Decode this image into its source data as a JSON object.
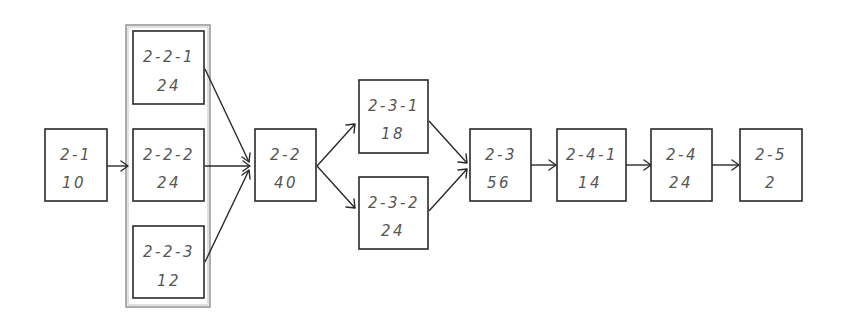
{
  "diagram": {
    "type": "network-schedule",
    "group": {
      "name": "parallel-group-2-2",
      "members": [
        "2-2-1",
        "2-2-2",
        "2-2-3"
      ]
    },
    "nodes": [
      {
        "id": "2-1",
        "label": "2-1",
        "value": "10"
      },
      {
        "id": "2-2-1",
        "label": "2-2-1",
        "value": "24"
      },
      {
        "id": "2-2-2",
        "label": "2-2-2",
        "value": "24"
      },
      {
        "id": "2-2-3",
        "label": "2-2-3",
        "value": "12"
      },
      {
        "id": "2-2",
        "label": "2-2",
        "value": "40"
      },
      {
        "id": "2-3-1",
        "label": "2-3-1",
        "value": "18"
      },
      {
        "id": "2-3-2",
        "label": "2-3-2",
        "value": "24"
      },
      {
        "id": "2-3",
        "label": "2-3",
        "value": "56"
      },
      {
        "id": "2-4-1",
        "label": "2-4-1",
        "value": "14"
      },
      {
        "id": "2-4",
        "label": "2-4",
        "value": "24"
      },
      {
        "id": "2-5",
        "label": "2-5",
        "value": "2"
      }
    ],
    "edges": [
      {
        "from": "2-1",
        "to": "2-2-group"
      },
      {
        "from": "2-2-1",
        "to": "2-2"
      },
      {
        "from": "2-2-2",
        "to": "2-2"
      },
      {
        "from": "2-2-3",
        "to": "2-2"
      },
      {
        "from": "2-2",
        "to": "2-3-1"
      },
      {
        "from": "2-2",
        "to": "2-3-2"
      },
      {
        "from": "2-3-1",
        "to": "2-3"
      },
      {
        "from": "2-3-2",
        "to": "2-3"
      },
      {
        "from": "2-3",
        "to": "2-4-1"
      },
      {
        "from": "2-4-1",
        "to": "2-4"
      },
      {
        "from": "2-4",
        "to": "2-5"
      }
    ],
    "colors": {
      "stroke": "#2a2a2a",
      "group_frame": "#8a8a8a",
      "text": "#555555",
      "background": "#ffffff"
    }
  }
}
